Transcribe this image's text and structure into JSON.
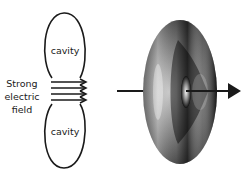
{
  "diagram": {
    "left_panel": {
      "cavity_top_label": "cavity",
      "cavity_bottom_label": "cavity",
      "field_label_lines": [
        "Strong",
        "electric",
        "field"
      ],
      "field_arrow_count": 4
    },
    "right_panel": {
      "shape": "torus",
      "axis_arrow": "arrow through torus center pointing right"
    },
    "colors": {
      "stroke": "#1a1a1a",
      "torus_dark": "#1c1c1c",
      "torus_light": "#d8d8d8",
      "background": "#ffffff"
    }
  }
}
